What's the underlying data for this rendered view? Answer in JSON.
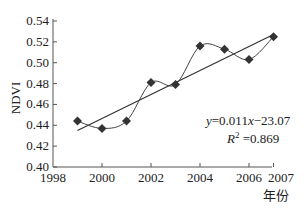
{
  "chart_data": {
    "type": "line",
    "title": "",
    "xlabel": "年份",
    "ylabel": "NDVI",
    "xlim": [
      1998,
      2007
    ],
    "ylim": [
      0.4,
      0.54
    ],
    "x_ticks": [
      "1998",
      "2000",
      "2002",
      "2004",
      "2006",
      "2007"
    ],
    "y_ticks": [
      "0.40",
      "0.42",
      "0.44",
      "0.46",
      "0.48",
      "0.50",
      "0.52",
      "0.54"
    ],
    "grid": false,
    "legend": null,
    "x": [
      1999,
      2000,
      2001,
      2002,
      2003,
      2004,
      2005,
      2006,
      2007
    ],
    "series": [
      {
        "name": "NDVI",
        "marker": "diamond",
        "line": "smooth",
        "values": [
          0.444,
          0.437,
          0.444,
          0.481,
          0.479,
          0.516,
          0.513,
          0.503,
          0.525
        ]
      },
      {
        "name": "linear fit",
        "marker": "none",
        "line": "straight",
        "x": [
          1999,
          2007
        ],
        "values": [
          0.435,
          0.527
        ]
      }
    ],
    "annotations": [
      {
        "text": "y=0.011x−23.07",
        "position": "lower-right"
      },
      {
        "text": "R² =0.869",
        "position": "lower-right"
      }
    ]
  },
  "labels": {
    "ylabel": "NDVI",
    "xlabel": "年份",
    "equation": "=0.011",
    "equation_y": "y",
    "equation_x": "x",
    "equation_tail": "−23.07",
    "r2_R": "R",
    "r2_sup": "2",
    "r2_val": " =0.869"
  }
}
